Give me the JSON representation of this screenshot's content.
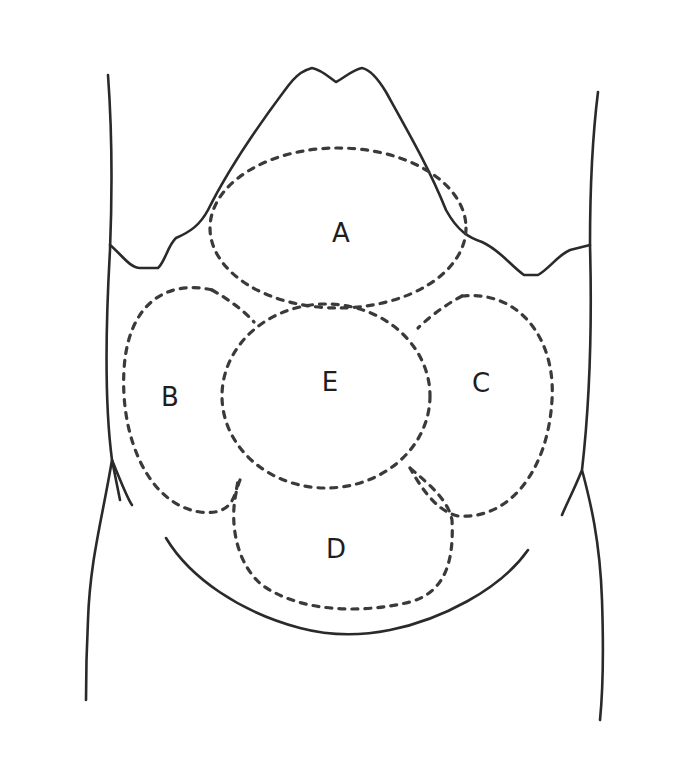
{
  "diagram": {
    "type": "anatomical-abdomen-regions",
    "colors": {
      "line": "#2a2a2a",
      "dashed": "#3a3a3a",
      "background": "#ffffff"
    },
    "regions": [
      {
        "id": "A",
        "label": "A",
        "position": "upper-center"
      },
      {
        "id": "B",
        "label": "B",
        "position": "left"
      },
      {
        "id": "C",
        "label": "C",
        "position": "right"
      },
      {
        "id": "D",
        "label": "D",
        "position": "lower-center"
      },
      {
        "id": "E",
        "label": "E",
        "position": "center"
      }
    ]
  }
}
